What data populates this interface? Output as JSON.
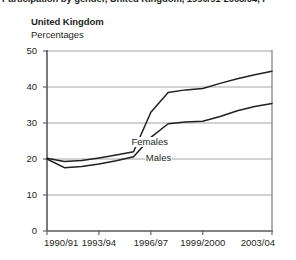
{
  "cut_title": "Participation by gender, United Kingdom, 1990/91-2003/04, P",
  "header": {
    "country": "United Kingdom",
    "units": "Percentages"
  },
  "chart_data": {
    "type": "line",
    "title": "United Kingdom",
    "subtitle": "Percentages",
    "xlabel": "",
    "ylabel": "Percentages",
    "ylim": [
      0,
      50
    ],
    "yticks": [
      0,
      10,
      20,
      30,
      40,
      50
    ],
    "ytick_labels": [
      "0",
      "10",
      "20",
      "30",
      "40",
      "50"
    ],
    "grid": true,
    "legend": "inline-labels",
    "x": [
      "1990/91",
      "1991/92",
      "1992/93",
      "1993/94",
      "1994/95",
      "1995/96",
      "1996/97",
      "1997/98",
      "1998/99",
      "1999/2000",
      "2000/01",
      "2001/02",
      "2002/03",
      "2003/04"
    ],
    "xtick_labels": [
      "1990/91",
      "1993/94",
      "1996/97",
      "1999/2000",
      "2003/04"
    ],
    "xtick_positions": [
      0,
      3,
      6,
      9,
      13
    ],
    "series": [
      {
        "name": "Females",
        "label": "Females",
        "color": "#231f20",
        "values": [
          20.2,
          19.3,
          19.6,
          20.3,
          21.1,
          22.0,
          33.0,
          38.5,
          39.2,
          39.6,
          41.0,
          42.3,
          43.4,
          44.4
        ]
      },
      {
        "name": "Males",
        "label": "Males",
        "color": "#231f20",
        "values": [
          20.0,
          17.6,
          17.9,
          18.6,
          19.5,
          20.6,
          26.0,
          29.8,
          30.3,
          30.5,
          31.8,
          33.4,
          34.6,
          35.4
        ]
      }
    ]
  },
  "colors": {
    "axis": "#58595b",
    "grid": "#8d8e90",
    "line": "#231f20",
    "text": "#231f20"
  }
}
